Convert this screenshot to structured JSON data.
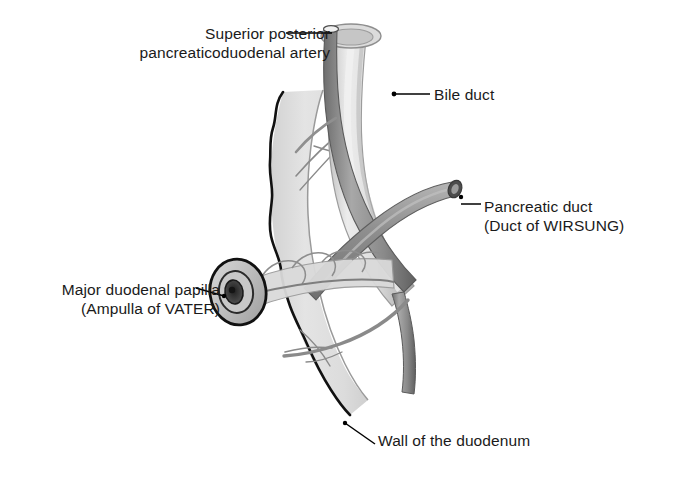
{
  "figure": {
    "background_color": "#ffffff",
    "width": 682,
    "height": 488
  },
  "labels": {
    "artery": {
      "name": "superior-posterior-pancreaticoduodenal-artery",
      "line1": "Superior posterior",
      "line2": "pancreaticoduodenal artery"
    },
    "bile_duct": {
      "name": "bile-duct",
      "line1": "Bile duct"
    },
    "pancreatic_duct": {
      "name": "pancreatic-duct",
      "line1": "Pancreatic duct",
      "line2": "(Duct of WIRSUNG)"
    },
    "papilla": {
      "name": "major-duodenal-papilla",
      "line1": "Major duodenal papilla",
      "line2": "(Ampulla of VATER)"
    },
    "duodenal_wall": {
      "name": "wall-of-the-duodenum",
      "line1": "Wall of the duodenum"
    }
  },
  "colors": {
    "text": "#1a1a1a",
    "leader_line": "#000000",
    "duodenal_wall_fill": "#e2e2e2",
    "duodenal_wall_outline": "#111111",
    "bile_duct_fill": "#d8d8d8",
    "bile_duct_outline": "#8e8e8e",
    "artery_fill": "#8e8e8e",
    "artery_outline": "#4a4a4a",
    "pancreatic_duct_fill": "#9a9a9a",
    "papilla_ring": "#111111",
    "papilla_opening": "#2a2a2a"
  }
}
